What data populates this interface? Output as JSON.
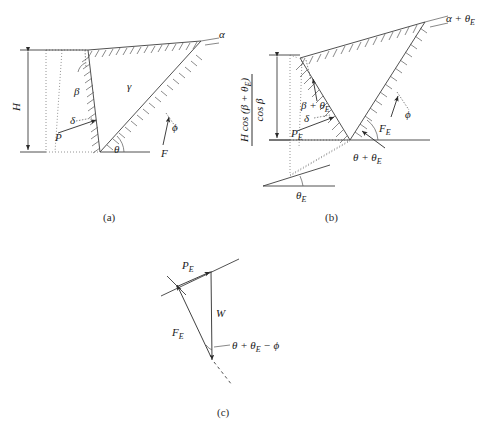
{
  "figure": {
    "background": "#ffffff",
    "line_color": "#3d3d3d",
    "text_color": "#1a1a1a",
    "width": 490,
    "height": 434
  },
  "panels": [
    {
      "id": "a",
      "caption": "(a)",
      "caption_pos": [
        103,
        221
      ],
      "description": "Static active wedge on retaining wall",
      "labels": [
        {
          "name": "alpha",
          "text": "α",
          "x": 221,
          "y": 37,
          "size": 11,
          "style": "italic"
        },
        {
          "name": "height-H",
          "text": "H",
          "x": 16,
          "y": 107,
          "size": 12,
          "style": "italic",
          "rotated": true
        },
        {
          "name": "beta",
          "text": "β",
          "x": 76,
          "y": 93,
          "size": 11,
          "style": "italic"
        },
        {
          "name": "gamma",
          "text": "γ",
          "x": 127,
          "y": 88,
          "size": 11,
          "style": "italic"
        },
        {
          "name": "delta",
          "text": "δ",
          "x": 71,
          "y": 123,
          "size": 11,
          "style": "italic"
        },
        {
          "name": "force-P",
          "text": "P",
          "x": 57,
          "y": 136,
          "size": 11,
          "style": "italic"
        },
        {
          "name": "theta",
          "text": "θ",
          "x": 114,
          "y": 152,
          "size": 11,
          "style": "italic"
        },
        {
          "name": "force-F",
          "text": "F",
          "x": 164,
          "y": 152,
          "size": 11,
          "style": "italic"
        },
        {
          "name": "phi",
          "text": "ϕ",
          "x": 173,
          "y": 126,
          "size": 11,
          "style": "italic"
        }
      ]
    },
    {
      "id": "b",
      "caption": "(b)",
      "caption_pos": [
        325,
        221
      ],
      "description": "Rotated wedge under seismic inertial rotation theta_E",
      "fraction": {
        "name": "effective-height",
        "numerator": "H cos (β + θ",
        "numerator_sub": "E",
        "numerator_tail": ")",
        "denominator": "cos β",
        "full_text": "H cos (β + θE) / cos β"
      },
      "labels": [
        {
          "name": "alpha-plus-thetaE",
          "text": "α + θ",
          "sub": "E",
          "x": 446,
          "y": 22,
          "size": 11,
          "style": "italic"
        },
        {
          "name": "beta-plus-thetaE",
          "text": "β + θ",
          "sub": "E",
          "x": 310,
          "y": 106,
          "size": 11,
          "style": "italic"
        },
        {
          "name": "delta-b",
          "text": "δ",
          "x": 305,
          "y": 120,
          "size": 11,
          "style": "italic"
        },
        {
          "name": "force-PE",
          "text": "P",
          "sub": "E",
          "x": 296,
          "y": 134,
          "size": 11,
          "style": "italic"
        },
        {
          "name": "force-FE",
          "text": "F",
          "sub": "E",
          "x": 383,
          "y": 130,
          "size": 11,
          "style": "italic"
        },
        {
          "name": "phi-b",
          "text": "ϕ",
          "x": 406,
          "y": 114,
          "size": 11,
          "style": "italic"
        },
        {
          "name": "theta-plus-thetaE",
          "text": "θ + θ",
          "sub": "E",
          "x": 358,
          "y": 159,
          "size": 11,
          "style": "italic"
        },
        {
          "name": "thetaE-ground",
          "text": "θ",
          "sub": "E",
          "x": 301,
          "y": 196,
          "size": 11,
          "style": "italic"
        }
      ]
    },
    {
      "id": "c",
      "caption": "(c)",
      "caption_pos": [
        217,
        416
      ],
      "description": "Force polygon of wedge equilibrium",
      "labels": [
        {
          "name": "force-PE-c",
          "text": "P",
          "sub": "E",
          "x": 184,
          "y": 267,
          "size": 11,
          "style": "italic"
        },
        {
          "name": "weight-W",
          "text": "W",
          "x": 218,
          "y": 315,
          "size": 11,
          "style": "italic"
        },
        {
          "name": "force-FE-c",
          "text": "F",
          "sub": "E",
          "x": 175,
          "y": 333,
          "size": 11,
          "style": "italic"
        },
        {
          "name": "angle-expr",
          "text": "θ + θ",
          "sub": "E",
          "tail": " − ϕ",
          "x": 233,
          "y": 348,
          "size": 11,
          "style": "italic"
        }
      ]
    }
  ],
  "symbols": {
    "alpha": "α",
    "beta": "β",
    "gamma": "γ",
    "delta": "δ",
    "theta": "θ",
    "phi": "ϕ",
    "subscript_E": "E",
    "plus": "+",
    "minus": "−"
  }
}
